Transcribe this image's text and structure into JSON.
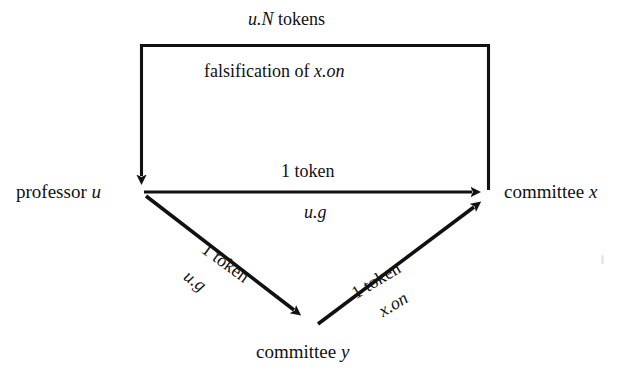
{
  "figure": {
    "type": "directed-graph",
    "background_color": "#ffffff",
    "stroke_color": "#111111",
    "nodes": [
      {
        "id": "professor-u",
        "label_plain": "professor u",
        "label_roman": "professor ",
        "label_italic": "u",
        "x": 142,
        "y": 192
      },
      {
        "id": "committee-x",
        "label_plain": "committee x",
        "label_roman": "committee ",
        "label_italic": "x",
        "x": 492,
        "y": 192
      },
      {
        "id": "committee-y",
        "label_plain": "committee y",
        "label_roman": "committee ",
        "label_italic": "y",
        "x": 312,
        "y": 326
      }
    ],
    "edges": [
      {
        "id": "edge-x-to-u",
        "from": "committee-x",
        "to": "professor-u",
        "shape": "orthogonal-top-route",
        "label_top_roman_suffix": " tokens",
        "label_top_italic": "u.N",
        "label_top_plain": "u.N tokens",
        "label_second_roman": "falsification of ",
        "label_second_italic": "x.on",
        "label_second_plain": "falsification of x.on"
      },
      {
        "id": "edge-u-to-x",
        "from": "professor-u",
        "to": "committee-x",
        "shape": "horizontal",
        "label_above": "1 token",
        "label_below_italic": "u.g",
        "label_below_plain": "u.g"
      },
      {
        "id": "edge-u-to-y",
        "from": "professor-u",
        "to": "committee-y",
        "shape": "diagonal-down-right",
        "label_above": "1 token",
        "label_below_italic": "u.g",
        "label_below_plain": "u.g"
      },
      {
        "id": "edge-y-to-x",
        "from": "committee-y",
        "to": "committee-x",
        "shape": "diagonal-up-right",
        "label_above": "1 token",
        "label_below_italic": "x.on",
        "label_below_plain": "x.on"
      }
    ]
  }
}
